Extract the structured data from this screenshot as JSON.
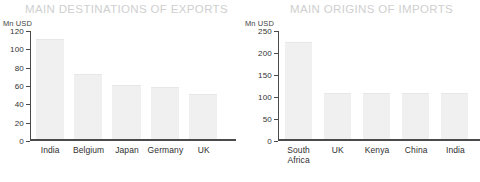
{
  "charts": [
    {
      "title": "MAIN DESTINATIONS OF EXPORTS",
      "unit_label": "Mn USD"
    },
    {
      "title": "MAIN ORIGINS OF IMPORTS",
      "unit_label": "Mn USD"
    }
  ],
  "chart_data": [
    {
      "type": "bar",
      "title": "MAIN DESTINATIONS OF EXPORTS",
      "xlabel": "",
      "ylabel": "Mn USD",
      "categories": [
        "India",
        "Belgium",
        "Japan",
        "Germany",
        "UK"
      ],
      "values": [
        110,
        71,
        59,
        57,
        49
      ],
      "ylim": [
        0,
        120
      ],
      "yticks": [
        0,
        20,
        40,
        60,
        80,
        100,
        120
      ],
      "ytick_labels": [
        "0",
        "20",
        "40",
        "60",
        "80",
        "100",
        "120"
      ],
      "grid": false,
      "legend": "none",
      "bar_color": "#f0f0f0",
      "axis_color": "#4a4a4a",
      "title_color": "#cfcfcf"
    },
    {
      "type": "bar",
      "title": "MAIN ORIGINS OF IMPORTS",
      "xlabel": "",
      "ylabel": "Mn USD",
      "categories": [
        "South\nAfrica",
        "UK",
        "Kenya",
        "China",
        "India"
      ],
      "values": [
        222,
        105,
        105,
        104,
        104
      ],
      "ylim": [
        0,
        250
      ],
      "yticks": [
        0,
        50,
        100,
        150,
        200,
        250
      ],
      "ytick_labels": [
        "0",
        "50",
        "100",
        "150",
        "200",
        "250"
      ],
      "grid": false,
      "legend": "none",
      "bar_color": "#f0f0f0",
      "axis_color": "#4a4a4a",
      "title_color": "#cfcfcf"
    }
  ]
}
